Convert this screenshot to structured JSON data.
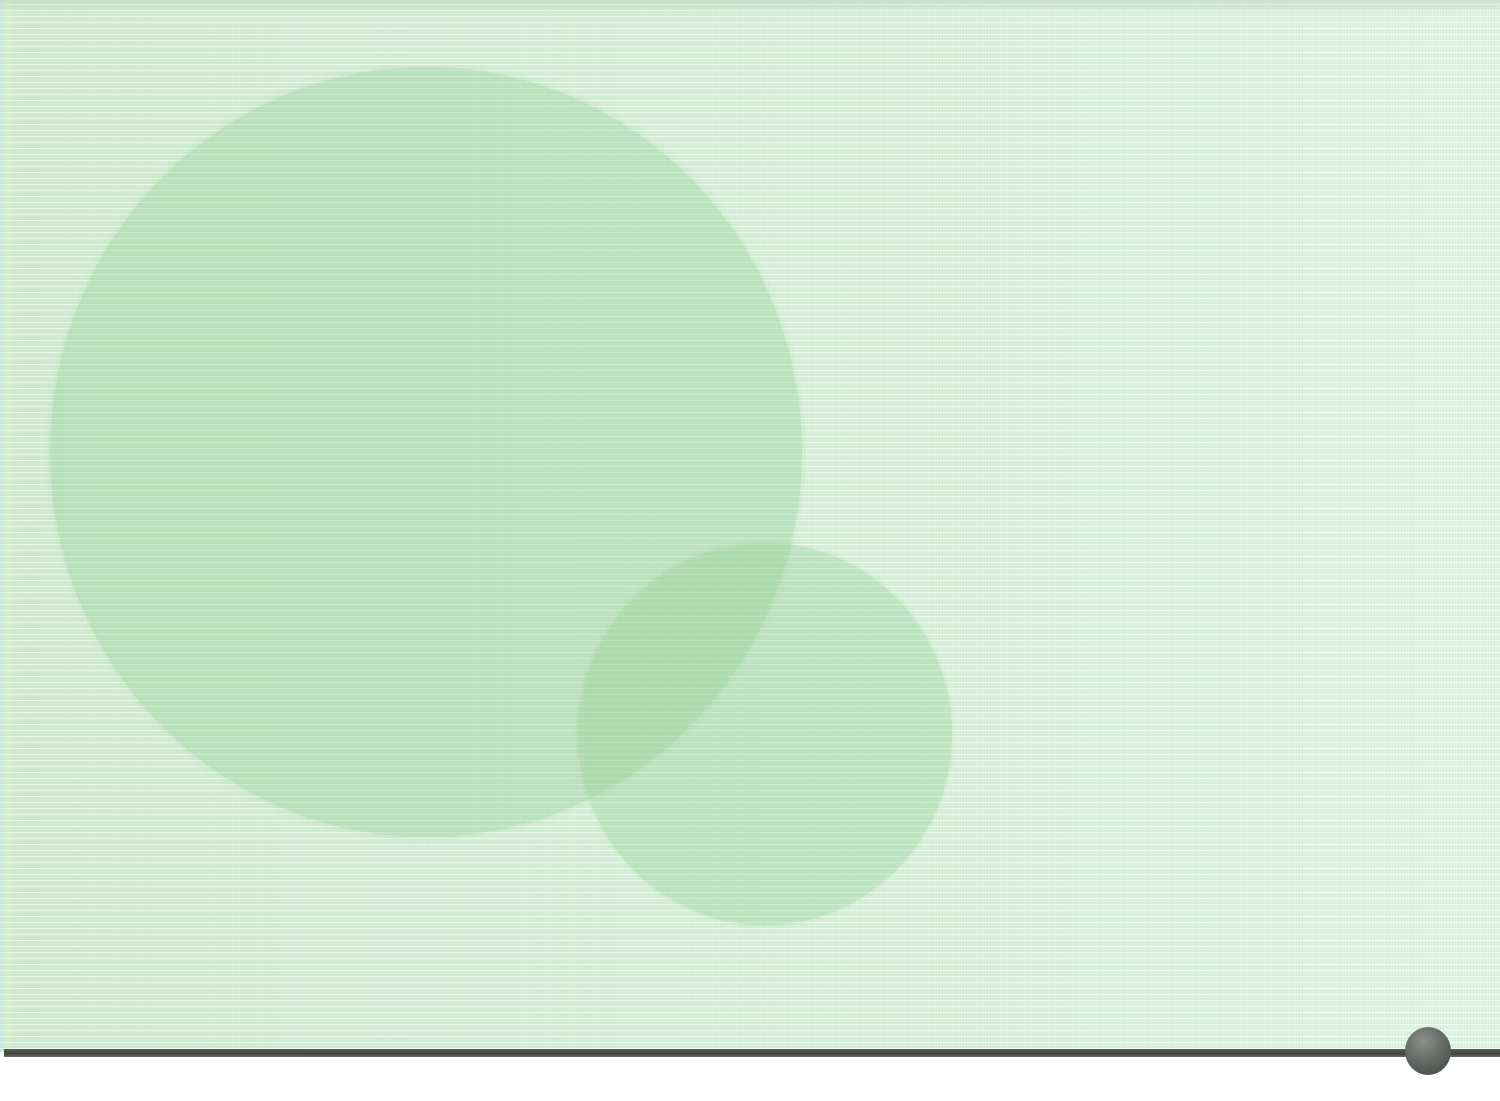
{
  "page": {
    "kind": "decorative-stationery-background",
    "text_content": []
  },
  "colors": {
    "paper": "#d6f3d9",
    "paper_lines": "#f6fff6",
    "circle_fill": "#96d096",
    "rule": "#464b48",
    "sphere": "#6a6e6b",
    "margin": "#ffffff"
  },
  "shapes": {
    "large_circle": {
      "left": 50,
      "top": 67,
      "width": 752,
      "height": 770
    },
    "small_circle": {
      "left": 578,
      "top": 543,
      "width": 374,
      "height": 382
    },
    "rule": {
      "left": 4,
      "top": 1049,
      "width": 1496,
      "height": 8
    },
    "sphere": {
      "left": 1405,
      "top": 1027,
      "diameter": 47
    }
  }
}
